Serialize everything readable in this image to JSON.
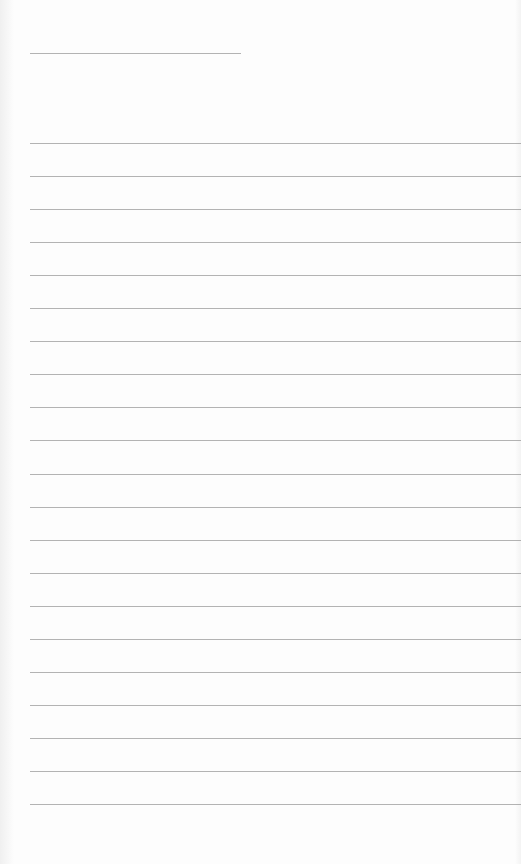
{
  "page": {
    "type": "blank-lined-page",
    "background_color": "#fdfdfd",
    "line_color": "#9a9a9a"
  },
  "header_line": {
    "x": 30,
    "y": 53,
    "width": 211
  },
  "ruled_lines": {
    "x": 30,
    "start_y": 143,
    "spacing": 33.05,
    "count": 21,
    "width": 491
  }
}
